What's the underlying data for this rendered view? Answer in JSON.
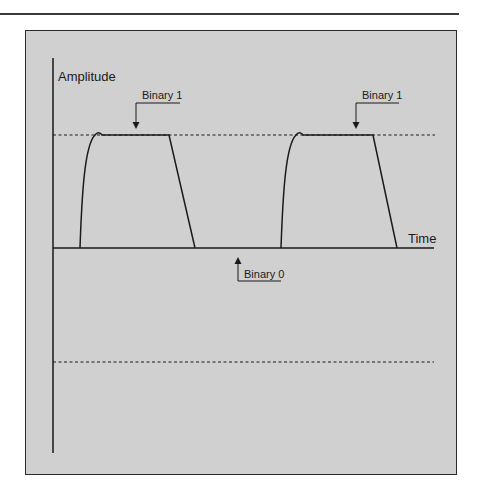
{
  "figure": {
    "y_axis_label": "Amplitude",
    "x_axis_label": "Time",
    "callouts": [
      {
        "label": "Binary 1",
        "direction": "down",
        "target": "first pulse top"
      },
      {
        "label": "Binary 1",
        "direction": "down",
        "target": "second pulse top"
      },
      {
        "label": "Binary 0",
        "direction": "up",
        "target": "baseline between pulses"
      }
    ],
    "reference_lines": [
      {
        "name": "positive-amplitude-level",
        "style": "dashed"
      },
      {
        "name": "negative-amplitude-level",
        "style": "dashed"
      }
    ],
    "colors": {
      "background": "#d0d0d0",
      "stroke": "#1a1a1a",
      "page": "#ffffff"
    }
  }
}
